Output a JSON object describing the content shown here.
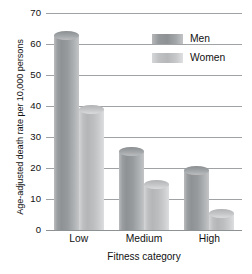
{
  "chart_data": {
    "type": "bar",
    "title": "",
    "xlabel": "Fitness category",
    "ylabel": "Age-adjusted death rate per 10,000 persons",
    "categories": [
      "Low",
      "Medium",
      "High"
    ],
    "series": [
      {
        "name": "Men",
        "values": [
          63,
          25.5,
          19.5
        ],
        "color": "#95989a"
      },
      {
        "name": "Women",
        "values": [
          39,
          15,
          5.5
        ],
        "color": "#c2c4c6"
      }
    ],
    "ylim": [
      0,
      70
    ],
    "yticks": [
      0,
      10,
      20,
      30,
      40,
      50,
      60,
      70
    ],
    "ytick_labels": [
      "0",
      "10",
      "20",
      "30",
      "40",
      "50",
      "60",
      "70"
    ],
    "grid": true,
    "grid_axis": "y",
    "legend_position": "top-right",
    "bar_style": "cylinder-gradient"
  },
  "legend": {
    "entries": [
      {
        "label": "Men"
      },
      {
        "label": "Women"
      }
    ]
  },
  "axes": {
    "y_title": "Age-adjusted death rate per 10,000 persons",
    "x_title": "Fitness category"
  }
}
